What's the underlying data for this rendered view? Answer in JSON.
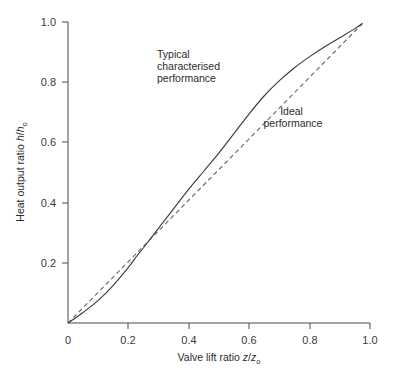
{
  "chart_data": {
    "type": "line",
    "title": "",
    "xlabel": "Valve lift ratio z/z₀",
    "ylabel": "Heat output ratio h/h₀",
    "xlabel_parts": {
      "text": "Valve lift ratio ",
      "var1": "z",
      "slash": "/",
      "var2": "z",
      "sub": "o"
    },
    "ylabel_parts": {
      "text": "Heat output ratio ",
      "var1": "h",
      "slash": "/",
      "var2": "h",
      "sub": "o"
    },
    "xlim": [
      0,
      1.0
    ],
    "ylim": [
      0,
      1.0
    ],
    "xticks": [
      0,
      0.2,
      0.4,
      0.6,
      0.8,
      1.0
    ],
    "yticks": [
      0,
      0.2,
      0.4,
      0.6,
      0.8,
      1.0
    ],
    "xticklabels": [
      "0",
      "0.2",
      "0.4",
      "0.6",
      "0.8",
      "1.0"
    ],
    "yticklabels": [
      "0",
      "0.2",
      "0.4",
      "0.6",
      "0.8",
      "1.0"
    ],
    "grid": false,
    "legend": "none (inline annotations)",
    "series": [
      {
        "name": "Typical characterised performance",
        "style": "solid",
        "color": "#3c3c3c",
        "x": [
          0.0,
          0.05,
          0.1,
          0.15,
          0.2,
          0.23,
          0.25,
          0.3,
          0.35,
          0.4,
          0.45,
          0.5,
          0.55,
          0.6,
          0.65,
          0.7,
          0.75,
          0.8,
          0.85,
          0.9,
          0.95,
          0.975
        ],
        "y": [
          0.0,
          0.035,
          0.075,
          0.125,
          0.185,
          0.225,
          0.25,
          0.315,
          0.38,
          0.445,
          0.505,
          0.565,
          0.63,
          0.695,
          0.755,
          0.805,
          0.848,
          0.885,
          0.918,
          0.948,
          0.978,
          0.995
        ]
      },
      {
        "name": "Ideal performance",
        "style": "dashed",
        "color": "#6a6a6a",
        "x": [
          0.0,
          0.975
        ],
        "y": [
          0.0,
          0.995
        ]
      }
    ],
    "annotations": [
      {
        "name": "typical-characterised-performance",
        "lines": [
          "Typical",
          "characterised",
          "performance"
        ],
        "align": "left",
        "x": 0.395,
        "y": 0.915
      },
      {
        "name": "ideal-performance",
        "lines": [
          "Ideal",
          "performance"
        ],
        "align": "middle",
        "x": 0.745,
        "y": 0.73
      }
    ],
    "crossover_point": [
      0.23,
      0.225
    ],
    "convergence_point": [
      0.975,
      0.995
    ]
  }
}
